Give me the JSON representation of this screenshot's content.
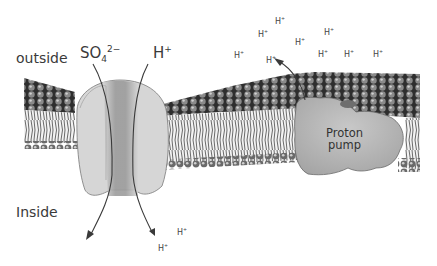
{
  "diagram": {
    "title": "",
    "regions": {
      "outside_label": "outside",
      "inside_label": "Inside"
    },
    "symporter": {
      "sulfate_label": {
        "base": "SO",
        "subscript": "4",
        "superscript": "2−"
      },
      "proton_label": {
        "base": "H",
        "superscript": "+"
      }
    },
    "proton_pump": {
      "label_line1": "Proton",
      "label_line2": "pump"
    },
    "scattered_protons_outside": [
      {
        "base": "H",
        "superscript": "+",
        "x": 234,
        "y": 52
      },
      {
        "base": "H",
        "superscript": "+",
        "x": 258,
        "y": 31
      },
      {
        "base": "H",
        "superscript": "+",
        "x": 275,
        "y": 18
      },
      {
        "base": "H",
        "superscript": "+",
        "x": 295,
        "y": 39
      },
      {
        "base": "H",
        "superscript": "+",
        "x": 324,
        "y": 29
      },
      {
        "base": "H",
        "superscript": "+",
        "x": 266,
        "y": 57
      },
      {
        "base": "H",
        "superscript": "+",
        "x": 318,
        "y": 51
      },
      {
        "base": "H",
        "superscript": "+",
        "x": 344,
        "y": 51
      },
      {
        "base": "H",
        "superscript": "+",
        "x": 373,
        "y": 51
      }
    ],
    "scattered_protons_inside": [
      {
        "base": "H",
        "superscript": "+",
        "x": 177,
        "y": 229
      },
      {
        "base": "H",
        "superscript": "+",
        "x": 158,
        "y": 245
      }
    ],
    "colors": {
      "background": "#ffffff",
      "head_groups": "#4a4a4a",
      "tails": "#d8d8d8",
      "protein_light": "#cfcfcf",
      "protein_mid": "#a9a9a9",
      "arrow": "#444444"
    }
  }
}
